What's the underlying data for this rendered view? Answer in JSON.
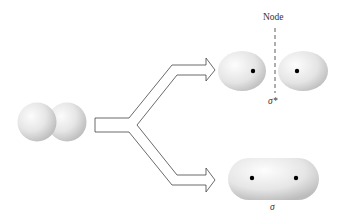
{
  "diagram": {
    "labels": {
      "node": "Node",
      "antibonding": "σ*",
      "bonding": "σ"
    },
    "colors": {
      "background": "#ffffff",
      "orbital_light": "#fafafa",
      "orbital_shade": "#c8c8c8",
      "arrow_stroke": "#444444",
      "nucleus": "#000000",
      "node_line": "#333333"
    },
    "elements": {
      "atomic_orbitals": "Two overlapping s orbitals",
      "branch_arrow": "Y-shaped hollow arrow splitting into two paths",
      "antibonding_orbital": "Two separated lobes with nuclei, node plane between",
      "bonding_orbital": "Single elongated lobe enclosing both nuclei"
    }
  }
}
